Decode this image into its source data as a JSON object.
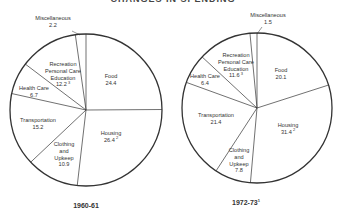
{
  "header": {
    "cut_title": "CHANGES IN SPENDING"
  },
  "chart_data": [
    {
      "type": "pie",
      "title": "1960-61",
      "title_footnote": "",
      "start_angle_deg": 0,
      "direction": "clockwise",
      "center": [
        86,
        110
      ],
      "radius": 76,
      "categories": [
        "Food",
        "Housing",
        "Clothing and Upkeep",
        "Transportation",
        "Health Care",
        "Recreation Personal Care Education",
        "Miscellaneous"
      ],
      "values": [
        24.4,
        26.4,
        10.9,
        15.2,
        6.7,
        12.2,
        2.2
      ],
      "footnotes": {
        "Housing": "2",
        "Recreation Personal Care Education": "3"
      },
      "labels": [
        {
          "lines": [
            "Food",
            "24.4"
          ],
          "x": 111,
          "y": 78
        },
        {
          "lines": [
            "Housing",
            "26.4"
          ],
          "x": 111,
          "y": 135,
          "sup": "2"
        },
        {
          "lines": [
            "Clothing",
            "and",
            "Upkeep",
            "10.9"
          ],
          "x": 64,
          "y": 146
        },
        {
          "lines": [
            "Transportation",
            "15.2"
          ],
          "x": 38,
          "y": 122
        },
        {
          "lines": [
            "Health Care",
            "6.7"
          ],
          "x": 34,
          "y": 90
        },
        {
          "lines": [
            "Recreation",
            "Personal Care",
            "Education",
            "12.2"
          ],
          "x": 63,
          "y": 66,
          "sup": "3"
        },
        {
          "lines": [
            "Miscellaneous",
            "2.2"
          ],
          "x": 53,
          "y": 20,
          "leader": [
            [
              72,
              31
            ],
            [
              80,
              35
            ]
          ]
        }
      ]
    },
    {
      "type": "pie",
      "title": "1972-73",
      "title_footnote": "1",
      "start_angle_deg": 0,
      "direction": "clockwise",
      "center": [
        257,
        108
      ],
      "radius": 75,
      "categories": [
        "Food",
        "Housing",
        "Clothing and Upkeep",
        "Transportation",
        "Health Care",
        "Recreation Personal Care Education",
        "Miscellaneous"
      ],
      "values": [
        20.1,
        31.4,
        7.8,
        21.4,
        6.4,
        11.6,
        1.5
      ],
      "footnotes": {
        "Housing": "2",
        "Recreation Personal Care Education": "3"
      },
      "labels": [
        {
          "lines": [
            "Food",
            "20.1"
          ],
          "x": 281,
          "y": 72
        },
        {
          "lines": [
            "Housing",
            "31.4"
          ],
          "x": 288,
          "y": 127,
          "sup": "2"
        },
        {
          "lines": [
            "Clothing",
            "and",
            "Upkeep",
            "7.8"
          ],
          "x": 239,
          "y": 152
        },
        {
          "lines": [
            "Transportation",
            "21.4"
          ],
          "x": 216,
          "y": 117
        },
        {
          "lines": [
            "Health Care",
            "6.4"
          ],
          "x": 205,
          "y": 78
        },
        {
          "lines": [
            "Recreation",
            "Personal Care",
            "Education",
            "11.6"
          ],
          "x": 236,
          "y": 57,
          "sup": "3"
        },
        {
          "lines": [
            "Miscellaneous",
            "1.5"
          ],
          "x": 268,
          "y": 17,
          "leader": [
            [
              262,
              27
            ],
            [
              257,
              34
            ]
          ]
        }
      ]
    }
  ],
  "captions": [
    {
      "text": "1960-61",
      "sup": "",
      "x": 86,
      "y": 208
    },
    {
      "text": "1972-73",
      "sup": "1",
      "x": 246,
      "y": 205
    }
  ],
  "colors": {
    "stroke": "#333333",
    "fill": "#ffffff",
    "text": "#333333"
  }
}
